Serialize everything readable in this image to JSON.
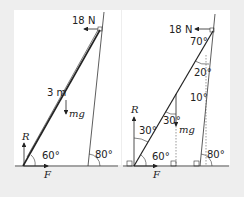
{
  "diagram_left": {
    "force_top": "18 N",
    "length": "3 m",
    "weight": "mg",
    "reaction": "R",
    "friction": "F",
    "angle_ground": "60°",
    "angle_wall": "80°"
  },
  "diagram_right": {
    "force_top": "18 N",
    "angle_top": "70°",
    "angle_mid": "20°",
    "angle_wall_vertical": "10°",
    "angle_r": "30°",
    "angle_mg": "30°",
    "weight": "mg",
    "reaction": "R",
    "friction": "F",
    "angle_ground": "60°",
    "angle_wall": "80°"
  }
}
